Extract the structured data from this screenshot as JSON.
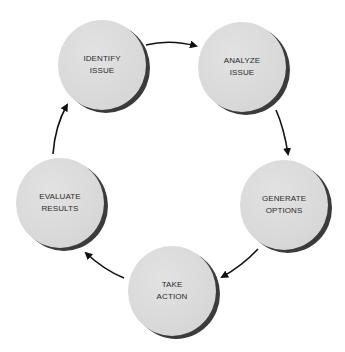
{
  "diagram": {
    "type": "cycle",
    "colors": {
      "node_fill": "#dadada",
      "node_shadow": "#3b3b3b",
      "text": "#2b2b2b",
      "arrow": "#111111",
      "background": "#ffffff"
    },
    "nodes": [
      {
        "id": "identify",
        "line1": "IDENTIFY",
        "line2": "ISSUE",
        "x": 58,
        "y": 20
      },
      {
        "id": "analyze",
        "line1": "ANALYZE",
        "line2": "ISSUE",
        "x": 198,
        "y": 22
      },
      {
        "id": "generate",
        "line1": "GENERATE",
        "line2": "OPTIONS",
        "x": 240,
        "y": 160
      },
      {
        "id": "take",
        "line1": "TAKE",
        "line2": "ACTION",
        "x": 128,
        "y": 246
      },
      {
        "id": "evaluate",
        "line1": "EVALUATE",
        "line2": "RESULTS",
        "x": 16,
        "y": 158
      }
    ],
    "edges": [
      {
        "from": "identify",
        "to": "analyze"
      },
      {
        "from": "analyze",
        "to": "generate"
      },
      {
        "from": "generate",
        "to": "take"
      },
      {
        "from": "take",
        "to": "evaluate"
      },
      {
        "from": "evaluate",
        "to": "identify"
      }
    ]
  }
}
